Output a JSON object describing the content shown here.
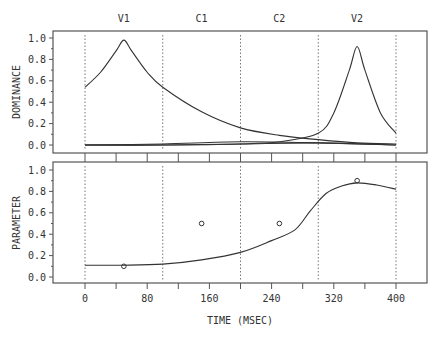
{
  "chart_data": [
    {
      "type": "line",
      "panel": "top",
      "title": "",
      "xlabel": "",
      "ylabel": "DOMINANCE",
      "xlim": [
        -40,
        440
      ],
      "ylim": [
        0,
        1.0
      ],
      "yticks": [
        "0.0",
        "0.2",
        "0.4",
        "0.6",
        "0.8",
        "1.0"
      ],
      "segment_labels": [
        "V1",
        "C1",
        "C2",
        "V2"
      ],
      "segment_centers": [
        50,
        150,
        250,
        350
      ],
      "segment_boundaries": [
        0,
        100,
        200,
        300,
        400
      ],
      "series": [
        {
          "name": "V1",
          "x": [
            0,
            20,
            40,
            50,
            60,
            80,
            100,
            150,
            200,
            250,
            300,
            350,
            400
          ],
          "values": [
            0.54,
            0.68,
            0.88,
            0.98,
            0.88,
            0.68,
            0.54,
            0.31,
            0.16,
            0.09,
            0.05,
            0.02,
            0.01
          ]
        },
        {
          "name": "V2",
          "x": [
            0,
            100,
            200,
            250,
            300,
            320,
            340,
            350,
            360,
            380,
            400
          ],
          "values": [
            0.0,
            0.0,
            0.01,
            0.03,
            0.11,
            0.3,
            0.7,
            0.92,
            0.7,
            0.3,
            0.11
          ]
        },
        {
          "name": "C1",
          "x": [
            0,
            100,
            200,
            300,
            400
          ],
          "values": [
            0.0,
            0.01,
            0.03,
            0.02,
            0.0
          ]
        },
        {
          "name": "C2",
          "x": [
            0,
            100,
            200,
            300,
            400
          ],
          "values": [
            0.0,
            0.0,
            0.01,
            0.02,
            0.0
          ]
        }
      ]
    },
    {
      "type": "line",
      "panel": "bottom",
      "title": "",
      "xlabel": "TIME (MSEC)",
      "ylabel": "PARAMETER",
      "xlim": [
        -40,
        440
      ],
      "ylim": [
        0,
        1.0
      ],
      "xticks": [
        "0",
        "80",
        "160",
        "240",
        "320",
        "400"
      ],
      "yticks": [
        "0.0",
        "0.2",
        "0.4",
        "0.6",
        "0.8",
        "1.0"
      ],
      "segment_boundaries": [
        0,
        100,
        200,
        300,
        400
      ],
      "series": [
        {
          "name": "parameter",
          "x": [
            0,
            50,
            100,
            150,
            200,
            240,
            270,
            290,
            310,
            330,
            350,
            375,
            400
          ],
          "values": [
            0.11,
            0.11,
            0.12,
            0.16,
            0.23,
            0.34,
            0.44,
            0.62,
            0.78,
            0.85,
            0.88,
            0.86,
            0.82
          ]
        },
        {
          "name": "targets",
          "x": [
            50,
            150,
            250,
            350
          ],
          "values": [
            0.1,
            0.5,
            0.5,
            0.9
          ],
          "marker": "circle"
        }
      ]
    }
  ]
}
